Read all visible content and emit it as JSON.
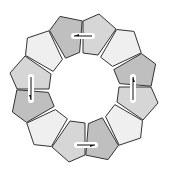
{
  "diagram": {
    "title": "",
    "center": [
      84,
      88
    ],
    "pentagon_count": 12,
    "base_pentagon": [
      [
        -1,
        -67
      ],
      [
        15,
        -74
      ],
      [
        32,
        -59
      ],
      [
        14,
        -33
      ],
      [
        -1,
        -35
      ]
    ],
    "rotation_step_deg": 30,
    "colors": {
      "dark": "#bfbfbf",
      "medium": "#d6d6d6",
      "light": "#efefef",
      "stroke": "#333333",
      "arrow": "#111111",
      "arrow_halo": "#ffffff"
    },
    "pentagon_shades": [
      "medium",
      "light",
      "dark",
      "medium",
      "light",
      "dark",
      "medium",
      "light",
      "dark",
      "medium",
      "light",
      "dark"
    ],
    "arrows": [
      {
        "name": "top-arrow",
        "from": [
          92,
          36
        ],
        "to": [
          74,
          36
        ],
        "direction": "left"
      },
      {
        "name": "right-arrow",
        "from": [
          133,
          100
        ],
        "to": [
          133,
          77
        ],
        "direction": "up"
      },
      {
        "name": "bottom-arrow",
        "from": [
          77,
          145
        ],
        "to": [
          95,
          145
        ],
        "direction": "right"
      },
      {
        "name": "left-arrow",
        "from": [
          31,
          77
        ],
        "to": [
          31,
          100
        ],
        "direction": "down"
      }
    ]
  }
}
